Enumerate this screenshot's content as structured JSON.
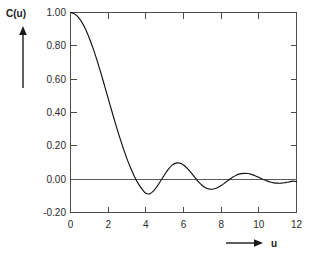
{
  "chart_data": {
    "type": "line",
    "title": "",
    "subtitle": "",
    "xlabel": "u",
    "ylabel": "C(u)",
    "xlim": [
      0,
      12
    ],
    "ylim": [
      -0.2,
      1.0
    ],
    "grid": false,
    "legend": null,
    "x_ticks": [
      "0",
      "2",
      "4",
      "6",
      "8",
      "10",
      "12"
    ],
    "x_tick_values": [
      0,
      2,
      4,
      6,
      8,
      10,
      12
    ],
    "y_ticks": [
      "1.00",
      "0.80",
      "0.60",
      "0.40",
      "0.20",
      "0.00",
      "-0.20"
    ],
    "y_tick_values": [
      1.0,
      0.8,
      0.6,
      0.4,
      0.2,
      0.0,
      -0.2
    ],
    "reference_lines": [
      {
        "name": "zero-line",
        "axis": "y",
        "value": 0.0
      }
    ],
    "annotations": [
      {
        "name": "y-axis-arrow",
        "text": "C(u)",
        "direction": "up"
      },
      {
        "name": "x-axis-arrow",
        "text": "u",
        "direction": "right"
      }
    ],
    "series": [
      {
        "name": "C(u)",
        "color": "#111111",
        "x": [
          0.0,
          0.2,
          0.4,
          0.6,
          0.8,
          1.0,
          1.2,
          1.4,
          1.6,
          1.8,
          2.0,
          2.2,
          2.4,
          2.6,
          2.8,
          3.0,
          3.2,
          3.4,
          3.6,
          3.8,
          4.0,
          4.2,
          4.4,
          4.6,
          4.8,
          5.0,
          5.2,
          5.4,
          5.6,
          5.8,
          6.0,
          6.2,
          6.4,
          6.6,
          6.8,
          7.0,
          7.2,
          7.4,
          7.6,
          7.8,
          8.0,
          8.2,
          8.4,
          8.6,
          8.8,
          9.0,
          9.2,
          9.4,
          9.6,
          9.8,
          10.0,
          10.2,
          10.4,
          10.6,
          10.8,
          11.0,
          11.2,
          11.4,
          11.6,
          11.8,
          12.0
        ],
        "y": [
          1.0,
          0.993,
          0.974,
          0.942,
          0.899,
          0.846,
          0.785,
          0.716,
          0.642,
          0.564,
          0.485,
          0.406,
          0.329,
          0.255,
          0.186,
          0.122,
          0.065,
          0.015,
          -0.027,
          -0.06,
          -0.085,
          -0.088,
          -0.072,
          -0.043,
          -0.008,
          0.028,
          0.06,
          0.084,
          0.096,
          0.096,
          0.085,
          0.065,
          0.039,
          0.011,
          -0.016,
          -0.038,
          -0.053,
          -0.06,
          -0.059,
          -0.051,
          -0.038,
          -0.022,
          -0.005,
          0.011,
          0.024,
          0.032,
          0.035,
          0.034,
          0.029,
          0.021,
          0.011,
          0.0,
          -0.009,
          -0.017,
          -0.022,
          -0.024,
          -0.024,
          -0.021,
          -0.017,
          -0.012,
          -0.015
        ],
        "key_points": {
          "start_value": 1.0,
          "first_zero_crossing": 4.4,
          "first_minimum": {
            "x": 5.7,
            "y": -0.09
          },
          "second_zero_crossing": 7.7,
          "second_maximum": {
            "x": 9.0,
            "y": 0.035
          },
          "third_zero_crossing": 11.2,
          "end_value": -0.015
        }
      }
    ]
  },
  "style": {
    "curve_color": "#111111",
    "frame_color": "#4d4d4d",
    "text_color": "#2b2b2b",
    "background": "#ffffff"
  }
}
